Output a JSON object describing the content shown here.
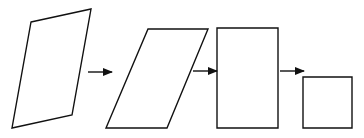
{
  "diagram": {
    "stroke_color": "#111111",
    "background": "#ffffff",
    "shapes": [
      {
        "name": "skewed-quadrilateral",
        "points": "31,22 91,9 72,115 12,128"
      },
      {
        "name": "parallelogram",
        "points": "148,29 208,29 167,128 106,128"
      },
      {
        "name": "rectangle",
        "points": "217,28 278,28 278,128 217,128"
      },
      {
        "name": "square",
        "points": "303,77 352,77 352,128 303,128"
      }
    ],
    "arrows": [
      {
        "name": "arrow-1",
        "x1": 88,
        "y1": 72,
        "x2": 112,
        "y2": 72
      },
      {
        "name": "arrow-2",
        "x1": 193,
        "y1": 71,
        "x2": 217,
        "y2": 71
      },
      {
        "name": "arrow-3",
        "x1": 280,
        "y1": 71,
        "x2": 304,
        "y2": 71
      }
    ]
  }
}
